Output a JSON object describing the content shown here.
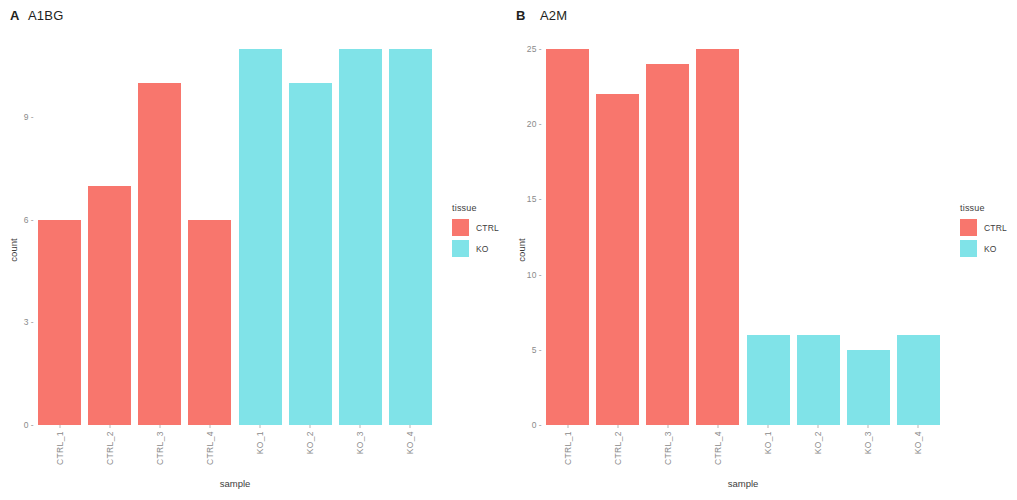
{
  "figure": {
    "background": "#ffffff",
    "colors": {
      "CTRL": "#f8766d",
      "KO": "#80e3e8"
    }
  },
  "panels": [
    {
      "tag": "A",
      "title": "A1BG",
      "legend": {
        "title": "tissue",
        "items": [
          {
            "label": "CTRL",
            "color": "#f8766d"
          },
          {
            "label": "KO",
            "color": "#80e3e8"
          }
        ]
      },
      "chart_data": {
        "type": "bar",
        "title": "A1BG",
        "xlabel": "sample",
        "ylabel": "count",
        "categories": [
          "CTRL_1",
          "CTRL_2",
          "CTRL_3",
          "CTRL_4",
          "KO_1",
          "KO_2",
          "KO_3",
          "KO_4"
        ],
        "values": [
          6,
          7,
          10,
          6,
          11,
          10,
          11,
          11
        ],
        "groups": [
          "CTRL",
          "CTRL",
          "CTRL",
          "CTRL",
          "KO",
          "KO",
          "KO",
          "KO"
        ],
        "yticks": [
          0,
          3,
          6,
          9
        ],
        "ylim": [
          0,
          11.7
        ],
        "grid": false,
        "legend_position": "right"
      }
    },
    {
      "tag": "B",
      "title": "A2M",
      "legend": {
        "title": "tissue",
        "items": [
          {
            "label": "CTRL",
            "color": "#f8766d"
          },
          {
            "label": "KO",
            "color": "#80e3e8"
          }
        ]
      },
      "chart_data": {
        "type": "bar",
        "title": "A2M",
        "xlabel": "sample",
        "ylabel": "count",
        "categories": [
          "CTRL_1",
          "CTRL_2",
          "CTRL_3",
          "CTRL_4",
          "KO_1",
          "KO_2",
          "KO_3",
          "KO_4"
        ],
        "values": [
          25,
          22,
          24,
          25,
          6,
          6,
          5,
          6
        ],
        "groups": [
          "CTRL",
          "CTRL",
          "CTRL",
          "CTRL",
          "KO",
          "KO",
          "KO",
          "KO"
        ],
        "yticks": [
          0,
          5,
          10,
          15,
          20,
          25
        ],
        "ylim": [
          0,
          26.6
        ],
        "grid": false,
        "legend_position": "right"
      }
    }
  ]
}
